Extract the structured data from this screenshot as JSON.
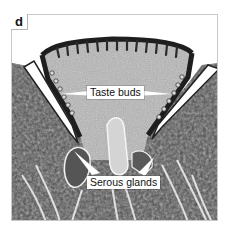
{
  "figure": {
    "panel_label": "d",
    "annotations": [
      {
        "id": "taste-buds",
        "text": "Taste buds"
      },
      {
        "id": "serous-glands",
        "text": "Serous glands"
      }
    ]
  }
}
